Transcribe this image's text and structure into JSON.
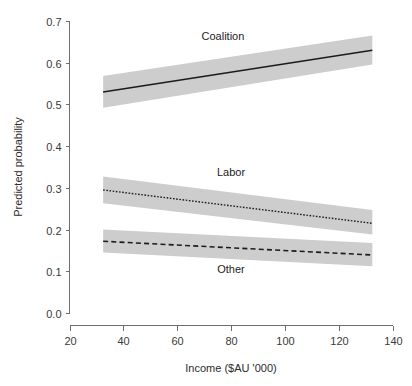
{
  "chart_data": {
    "type": "line",
    "title": "",
    "subtitle": "",
    "xlabel": "Income ($AU '000)",
    "ylabel": "Predicted probability",
    "xlim": [
      20,
      140
    ],
    "ylim": [
      0.0,
      0.7
    ],
    "xticks": [
      20,
      40,
      60,
      80,
      100,
      120,
      140
    ],
    "xtick_labels": [
      "20",
      "40",
      "60",
      "80",
      "100",
      "120",
      "140"
    ],
    "yticks": [
      0.0,
      0.1,
      0.2,
      0.3,
      0.4,
      0.5,
      0.6,
      0.7
    ],
    "ytick_labels": [
      "0.0",
      "0.1",
      "0.2",
      "0.3",
      "0.4",
      "0.5",
      "0.6",
      "0.7"
    ],
    "grid": false,
    "legend": "inline-annotations",
    "x_data_range": [
      32.5,
      132.5
    ],
    "band_color": "#cdcdcd",
    "line_color": "#1c1c1c",
    "series": [
      {
        "name": "Coalition",
        "linestyle": "solid",
        "x": [
          32.5,
          132.5
        ],
        "values": [
          0.53,
          0.63
        ],
        "ci_lower": [
          0.492,
          0.596
        ],
        "ci_upper": [
          0.568,
          0.665
        ],
        "label": "Coalition",
        "label_x": 77,
        "label_y": 0.655
      },
      {
        "name": "Labor",
        "linestyle": "dotted",
        "x": [
          32.5,
          132.5
        ],
        "values": [
          0.295,
          0.215
        ],
        "ci_lower": [
          0.263,
          0.188
        ],
        "ci_upper": [
          0.327,
          0.247
        ],
        "label": "Labor",
        "label_x": 80,
        "label_y": 0.328
      },
      {
        "name": "Other",
        "linestyle": "dashed",
        "x": [
          32.5,
          132.5
        ],
        "values": [
          0.172,
          0.139
        ],
        "ci_lower": [
          0.145,
          0.112
        ],
        "ci_upper": [
          0.2,
          0.168
        ],
        "label": "Other",
        "label_x": 80,
        "label_y": 0.095
      }
    ]
  },
  "axes": {
    "x_axis_name": "income-axis",
    "y_axis_name": "probability-axis"
  }
}
